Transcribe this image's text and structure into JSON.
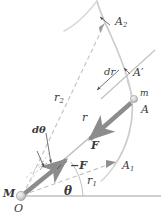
{
  "figure": {
    "kind": "physics-vector-diagram",
    "background_color": "#ffffff",
    "colors": {
      "orbit_curve": "#c9c9c9",
      "radius_line": "#b8b8b8",
      "dashed_line": "#c4c4c4",
      "axis_line": "#9a9a9a",
      "force_arrow": "#8c8c8c",
      "leader_line": "#555555",
      "label_text": "#3a3a3a",
      "mass_fill": "#d8d8d8"
    },
    "labels": [
      {
        "id": "A2",
        "text": "A",
        "sub": "2",
        "x": 115,
        "y": 16,
        "size": 11,
        "bold": false,
        "prime": false
      },
      {
        "id": "dr",
        "text": "dr",
        "sub": "",
        "x": 104,
        "y": 67,
        "size": 10,
        "bold": false,
        "prime": false
      },
      {
        "id": "Aprime",
        "text": "A",
        "sub": "",
        "x": 133,
        "y": 67,
        "size": 11,
        "bold": false,
        "prime": true
      },
      {
        "id": "m",
        "text": "m",
        "sub": "",
        "x": 140,
        "y": 89,
        "size": 9,
        "bold": false,
        "prime": false
      },
      {
        "id": "A",
        "text": "A",
        "sub": "",
        "x": 141,
        "y": 104,
        "size": 11,
        "bold": false,
        "prime": false
      },
      {
        "id": "r2",
        "text": "r",
        "sub": "2",
        "x": 54,
        "y": 92,
        "size": 11,
        "bold": false,
        "prime": false
      },
      {
        "id": "r",
        "text": "r",
        "sub": "",
        "x": 82,
        "y": 112,
        "size": 11,
        "bold": false,
        "prime": false
      },
      {
        "id": "dtheta",
        "text": "dθ",
        "sub": "",
        "x": 32,
        "y": 125,
        "size": 10,
        "bold": true,
        "prime": false
      },
      {
        "id": "F",
        "text": "F",
        "sub": "",
        "x": 91,
        "y": 140,
        "size": 11,
        "bold": true,
        "prime": false
      },
      {
        "id": "minusF",
        "text": "−F",
        "sub": "",
        "x": 70,
        "y": 160,
        "size": 11,
        "bold": true,
        "prime": false
      },
      {
        "id": "A1",
        "text": "A",
        "sub": "1",
        "x": 122,
        "y": 160,
        "size": 11,
        "bold": false,
        "prime": false
      },
      {
        "id": "r1",
        "text": "r",
        "sub": "1",
        "x": 87,
        "y": 175,
        "size": 11,
        "bold": false,
        "prime": false
      },
      {
        "id": "theta",
        "text": "θ",
        "sub": "",
        "x": 64,
        "y": 185,
        "size": 12,
        "bold": true,
        "prime": false
      },
      {
        "id": "M",
        "text": "M",
        "sub": "",
        "x": 3,
        "y": 188,
        "size": 11,
        "bold": true,
        "prime": false
      },
      {
        "id": "O",
        "text": "O",
        "sub": "",
        "x": 14,
        "y": 203,
        "size": 11,
        "bold": false,
        "prime": false
      }
    ],
    "points": {
      "M": {
        "x": 21,
        "y": 196
      },
      "A": {
        "x": 134,
        "y": 99
      },
      "A1": {
        "x": 115,
        "y": 163
      },
      "A2": {
        "x": 104,
        "y": 25
      },
      "Aprime": {
        "x": 127,
        "y": 79
      }
    },
    "geometry": {
      "orbit_path": "M 96,0 C 100,12 108,24 118,46 C 128,68 134,92 132,118 C 130,144 120,158 108,170",
      "radius_r_line": "M 21,196 L 134,99",
      "radius_r2_line": "M 21,196 L 104,25",
      "radius_r1_line": "M 21,196 L 115,163",
      "tangent_line": "M 104,96 L 152,52",
      "axis_line": "M 21,196 L 160,196"
    }
  }
}
